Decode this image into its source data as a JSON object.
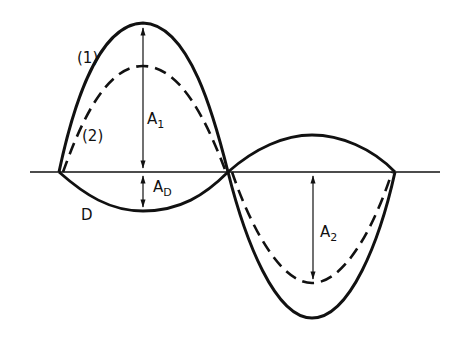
{
  "diagram": {
    "labels": {
      "curve1": "(1)",
      "curve2": "(2)",
      "A1": "A",
      "A1_sub": "1",
      "AD": "A",
      "AD_sub": "D",
      "D": "D",
      "A2": "A",
      "A2_sub": "2"
    },
    "colors": {
      "stroke": "#111111",
      "background": "#ffffff"
    }
  }
}
